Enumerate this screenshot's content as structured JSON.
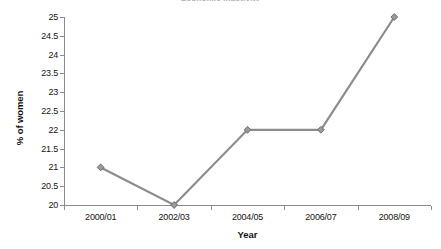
{
  "chart_data": {
    "type": "line",
    "title": "Economic inactivity",
    "xlabel": "Year",
    "ylabel": "% of women",
    "categories": [
      "2000/01",
      "2002/03",
      "2004/05",
      "2006/07",
      "2008/09"
    ],
    "values": [
      21,
      20,
      22,
      22,
      25
    ],
    "ylim": [
      20,
      25
    ],
    "ytick_labels": [
      "25",
      "24.5",
      "24",
      "23.5",
      "23",
      "22.5",
      "22",
      "21.5",
      "21",
      "20.5",
      "20"
    ],
    "ytick_values": [
      25,
      24.5,
      24,
      23.5,
      23,
      22.5,
      22,
      21.5,
      21,
      20.5,
      20
    ],
    "grid": false,
    "legend": false,
    "series": [
      {
        "name": "% of women",
        "values": [
          21,
          20,
          22,
          22,
          25
        ],
        "color": "#8c8c8c",
        "marker": "diamond"
      }
    ]
  },
  "colors": {
    "line": "#8c8c8c",
    "marker_fill": "#9a9a9a",
    "marker_edge": "#6e6e6e",
    "axis": "#8c8c8c",
    "text": "#141414",
    "background": "#ffffff"
  }
}
